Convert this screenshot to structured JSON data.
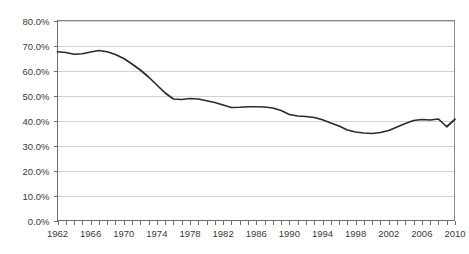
{
  "chart_data": {
    "type": "line",
    "title": "",
    "subtitle": "",
    "xlabel": "",
    "ylabel": "",
    "xlim": [
      1962,
      2010
    ],
    "ylim": [
      0,
      80
    ],
    "grid": true,
    "legend": false,
    "legend_position": "none",
    "y_tick_labels": [
      "0.0%",
      "10.0%",
      "20.0%",
      "30.0%",
      "40.0%",
      "50.0%",
      "60.0%",
      "70.0%",
      "80.0%"
    ],
    "y_tick_values": [
      0,
      10,
      20,
      30,
      40,
      50,
      60,
      70,
      80
    ],
    "x_tick_labels": [
      "1962",
      "1966",
      "1970",
      "1974",
      "1978",
      "1982",
      "1986",
      "1990",
      "1994",
      "1998",
      "2002",
      "2006",
      "2010"
    ],
    "x_tick_values": [
      1962,
      1966,
      1970,
      1974,
      1978,
      1982,
      1986,
      1990,
      1994,
      1998,
      2002,
      2006,
      2010
    ],
    "x_minor_tick_step": 1,
    "series": [
      {
        "name": "",
        "color": "#2b2b2b",
        "x": [
          1962,
          1963,
          1964,
          1965,
          1966,
          1967,
          1968,
          1969,
          1970,
          1971,
          1972,
          1973,
          1974,
          1975,
          1976,
          1977,
          1978,
          1979,
          1980,
          1981,
          1982,
          1983,
          1984,
          1985,
          1986,
          1987,
          1988,
          1989,
          1990,
          1991,
          1992,
          1993,
          1994,
          1995,
          1996,
          1997,
          1998,
          1999,
          2000,
          2001,
          2002,
          2003,
          2004,
          2005,
          2006,
          2007,
          2008,
          2009,
          2010
        ],
        "values": [
          67.5,
          67.2,
          66.5,
          66.7,
          67.4,
          68.0,
          67.5,
          66.4,
          64.8,
          62.6,
          60.2,
          57.4,
          54.2,
          51.0,
          48.6,
          48.4,
          48.8,
          48.6,
          47.9,
          47.2,
          46.2,
          45.2,
          45.3,
          45.5,
          45.5,
          45.4,
          45.0,
          44.0,
          42.4,
          41.8,
          41.6,
          41.2,
          40.3,
          39.0,
          37.8,
          36.2,
          35.4,
          35.0,
          34.8,
          35.2,
          36.0,
          37.4,
          38.8,
          40.0,
          40.4,
          40.2,
          40.6,
          37.5,
          40.5
        ]
      }
    ]
  },
  "axes": {
    "y_axis_name": "percent-axis",
    "x_axis_name": "year-axis"
  }
}
